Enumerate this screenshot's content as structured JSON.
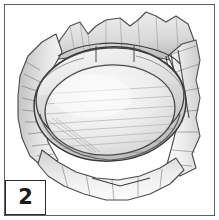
{
  "figure": {
    "step_number": "2",
    "caption": "",
    "media_type": "pencil line illustration",
    "frame_color": "#3a3a3a",
    "background_color": "#ffffff",
    "ink_color": "#3d3d3d",
    "shade_light": "#e9e9e9",
    "shade_mid": "#cfcfcf",
    "shade_dark": "#9a9a9a",
    "shade_deepest": "#5a5a5a"
  },
  "art": {
    "frame": {
      "x": 4,
      "y": 4,
      "width": 211,
      "height": 212,
      "stroke_width": 1.6
    },
    "badge": {
      "x": 5,
      "y": 180,
      "width": 41,
      "height": 35,
      "stroke_width": 1.6,
      "label": "2"
    },
    "wrapper_outline": "M 18 96 L 22 72 L 30 54 L 44 40 L 58 28 L 74 24 L 86 34 L 100 22 L 118 18 L 132 26 L 142 18 L 152 12 L 166 20 L 178 14 L 190 22 L 196 40 L 200 58 L 196 78 L 200 96 L 196 116 L 200 134 L 192 152 L 196 168 L 182 176 L 170 186 L 152 192 L 136 200 L 118 196 L 100 200 L 84 192 L 68 186 L 52 180 L 40 170 L 30 158 L 22 142 L 18 124 Z",
    "bowl": {
      "rim_outer": {
        "cx": 110,
        "cy": 98,
        "rx": 78,
        "ry": 58,
        "rotation": -4
      },
      "rim_inner": {
        "cx": 110,
        "cy": 108,
        "rx": 66,
        "ry": 46,
        "rotation": -4
      },
      "rim_top_arc_label": "outer rim top edge",
      "interior_label": "bowl interior basin"
    },
    "hatch_groups": [
      {
        "name": "top-wrapper-creases",
        "count": 16
      },
      {
        "name": "left-shadow-strokes",
        "count": 9
      },
      {
        "name": "interior-streaks",
        "count": 11
      },
      {
        "name": "right-fold-lines",
        "count": 7
      },
      {
        "name": "bottom-fold-lines",
        "count": 6
      }
    ]
  }
}
